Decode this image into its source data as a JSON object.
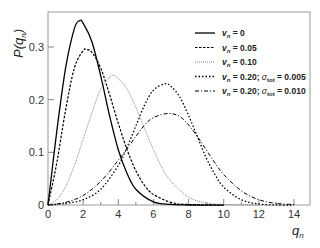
{
  "chart_data": {
    "type": "line",
    "title": "",
    "xlabel": "q_n",
    "ylabel": "P(q_n)",
    "xlim": [
      0,
      14.8
    ],
    "ylim": [
      0,
      0.37
    ],
    "xticks": [
      0,
      2,
      4,
      6,
      8,
      10,
      12,
      14
    ],
    "yticks": [
      0,
      0.1,
      0.2,
      0.3
    ],
    "ytick_labels": [
      "0",
      "0.1",
      "0.2",
      "0.3"
    ],
    "grid": false,
    "legend_position": "upper right",
    "series": [
      {
        "name": "v_n = 0",
        "style": "solid",
        "color": "#000000",
        "peak_x": 1.8,
        "peak_y": 0.35,
        "x": [
          0,
          0.5,
          1,
          1.5,
          1.8,
          2,
          2.5,
          3,
          3.5,
          4,
          4.5,
          5,
          6,
          7,
          8,
          10
        ],
        "y": [
          0,
          0.14,
          0.26,
          0.335,
          0.35,
          0.345,
          0.31,
          0.245,
          0.17,
          0.105,
          0.06,
          0.03,
          0.006,
          0.001,
          0,
          0
        ]
      },
      {
        "name": "v_n = 0.05",
        "style": "dashed",
        "color": "#000000",
        "peak_x": 2.2,
        "peak_y": 0.295,
        "x": [
          0,
          0.5,
          1,
          1.5,
          2,
          2.2,
          2.5,
          3,
          3.5,
          4,
          4.5,
          5,
          5.5,
          6,
          7,
          8,
          10
        ],
        "y": [
          0,
          0.08,
          0.18,
          0.26,
          0.293,
          0.295,
          0.29,
          0.26,
          0.21,
          0.155,
          0.105,
          0.065,
          0.037,
          0.02,
          0.005,
          0.001,
          0
        ]
      },
      {
        "name": "v_n = 0.10",
        "style": "dotted-fine",
        "color": "#666666",
        "peak_x": 3.6,
        "peak_y": 0.245,
        "x": [
          0,
          0.5,
          1,
          1.5,
          2,
          2.5,
          3,
          3.6,
          4,
          4.5,
          5,
          5.5,
          6,
          6.5,
          7,
          8,
          9,
          10,
          12
        ],
        "y": [
          0,
          0.01,
          0.035,
          0.075,
          0.125,
          0.175,
          0.22,
          0.245,
          0.24,
          0.22,
          0.185,
          0.145,
          0.105,
          0.07,
          0.045,
          0.015,
          0.004,
          0.001,
          0
        ]
      },
      {
        "name": "v_n = 0.20; σ_tot = 0.005",
        "style": "dash-dot-dot",
        "color": "#000000",
        "peak_x": 6.65,
        "peak_y": 0.23,
        "x": [
          0,
          1,
          2,
          3,
          4,
          4.5,
          5,
          5.5,
          6,
          6.65,
          7,
          7.5,
          8,
          8.5,
          9,
          9.5,
          10,
          11,
          12,
          13,
          14
        ],
        "y": [
          0,
          0.003,
          0.01,
          0.03,
          0.075,
          0.11,
          0.15,
          0.19,
          0.218,
          0.23,
          0.225,
          0.205,
          0.17,
          0.13,
          0.09,
          0.058,
          0.034,
          0.01,
          0.002,
          0,
          0
        ]
      },
      {
        "name": "v_n = 0.20; σ_tot = 0.010",
        "style": "dash-dot",
        "color": "#000000",
        "peak_x": 6.85,
        "peak_y": 0.174,
        "x": [
          0,
          1,
          2,
          3,
          4,
          5,
          5.5,
          6,
          6.85,
          7.5,
          8,
          8.5,
          9,
          9.5,
          10,
          11,
          12,
          13,
          14
        ],
        "y": [
          0,
          0.005,
          0.018,
          0.045,
          0.085,
          0.13,
          0.152,
          0.166,
          0.174,
          0.168,
          0.152,
          0.13,
          0.105,
          0.08,
          0.058,
          0.027,
          0.01,
          0.003,
          0.001
        ]
      }
    ]
  },
  "axes": {
    "xlabel_main": "q",
    "xlabel_sub": "n",
    "ylabel_prefix": "P(q",
    "ylabel_sub": "n",
    "ylabel_suffix": ")"
  },
  "legend": [
    {
      "v": "v",
      "sub": "n",
      "text": " = 0"
    },
    {
      "v": "v",
      "sub": "n",
      "text": " = 0.05"
    },
    {
      "v": "v",
      "sub": "n",
      "text": " = 0.10"
    },
    {
      "v": "v",
      "sub": "n",
      "text": " = 0.20; ",
      "sigma": "σ",
      "sigma_sub": "tot",
      "sigma_text": " = 0.005"
    },
    {
      "v": "v",
      "sub": "n",
      "text": " = 0.20; ",
      "sigma": "σ",
      "sigma_sub": "tot",
      "sigma_text": " = 0.010"
    }
  ]
}
